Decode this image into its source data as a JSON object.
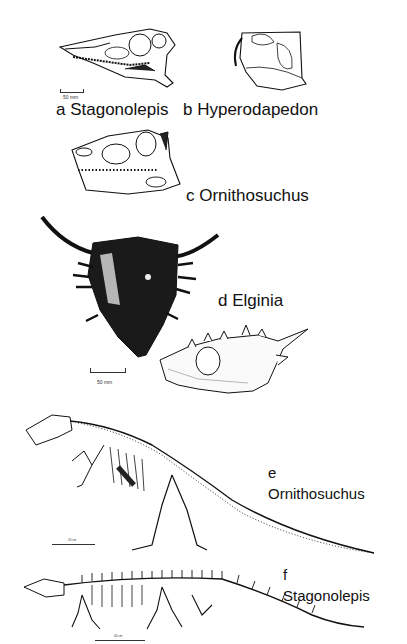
{
  "figure": {
    "panels": [
      {
        "id": "a",
        "taxon": "Stagonolepis",
        "label": "a Stagonolepis",
        "view": "skull lateral",
        "scale_bar": "50 mm"
      },
      {
        "id": "b",
        "taxon": "Hyperodapedon",
        "label": "b Hyperodapedon",
        "view": "skull lateral"
      },
      {
        "id": "c",
        "taxon": "Ornithosuchus",
        "label": "c Ornithosuchus",
        "view": "skull lateral"
      },
      {
        "id": "d",
        "taxon": "Elginia",
        "label": "d Elginia",
        "view": "skull dorsal and lateral",
        "scale_bar": "50 mm"
      },
      {
        "id": "e",
        "taxon": "Ornithosuchus",
        "letter": "e",
        "name": "Ornithosuchus",
        "view": "skeleton",
        "scale_bar": "20 cm"
      },
      {
        "id": "f",
        "taxon": "Stagonolepis",
        "letter": "f",
        "name": "Stagonolepis",
        "view": "skeleton",
        "scale_bar": "40 cm"
      }
    ]
  },
  "colors": {
    "ink": "#111111",
    "paper": "#ffffff",
    "bone_fill": "#ffffff",
    "dark_fill": "#1a1a1a"
  }
}
